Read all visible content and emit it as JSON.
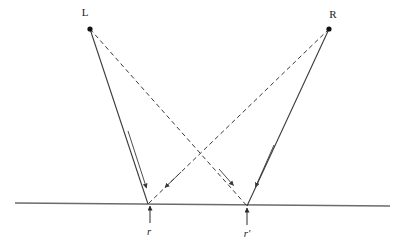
{
  "figure": {
    "type": "geometric-ray-diagram",
    "background_color": "#ffffff",
    "stroke_color": "#3a3a3a",
    "surface_color": "#6b6b6b",
    "width": 402,
    "height": 240
  },
  "labels": {
    "left_source": "L",
    "right_source": "R",
    "left_foot": "r",
    "right_foot": "r′"
  },
  "points": {
    "L": {
      "x": 90,
      "y": 29
    },
    "R": {
      "x": 329,
      "y": 29
    },
    "foot_left": {
      "x": 148,
      "y": 204
    },
    "foot_right": {
      "x": 247,
      "y": 206
    },
    "crossing": {
      "x": 210,
      "y": 155
    }
  },
  "surface_line": {
    "name": "ground-line",
    "x1": 15,
    "y1": 203,
    "x2": 390,
    "y2": 206
  },
  "rays": [
    {
      "name": "ray-L-to-foot-left",
      "style": "solid",
      "from": "L",
      "to": "foot_left",
      "arrow_at": {
        "x": 146,
        "y": 188
      }
    },
    {
      "name": "ray-R-to-foot-right",
      "style": "solid",
      "from": "R",
      "to": "foot_right",
      "arrow_at": {
        "x": 255,
        "y": 187
      }
    },
    {
      "name": "ray-L-to-foot-right",
      "style": "dashed",
      "from": "L",
      "to": "foot_right",
      "arrow_at": {
        "x": 233,
        "y": 185
      }
    },
    {
      "name": "ray-R-to-foot-left",
      "style": "dashed",
      "from": "R",
      "to": "foot_left",
      "arrow_at": {
        "x": 165,
        "y": 188
      }
    }
  ],
  "normals": [
    {
      "name": "normal-arrow-left",
      "x": 150,
      "y_tail": 223,
      "y_head": 206,
      "label": "r",
      "label_x": 148,
      "label_y": 234
    },
    {
      "name": "normal-arrow-right",
      "x": 247,
      "y_tail": 225,
      "y_head": 208,
      "label": "r′",
      "label_x": 245,
      "label_y": 236
    }
  ]
}
